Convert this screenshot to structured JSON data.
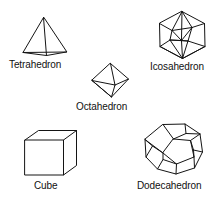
{
  "figure": {
    "title_text": "",
    "background_color": "#ffffff",
    "stroke_color": "#141414",
    "label_color": "#111111",
    "type": "line-drawing",
    "solids": [
      {
        "id": "tetrahedron",
        "label": "Tetrahedron",
        "faces": 4,
        "face_shape": "triangle",
        "label_position": "below"
      },
      {
        "id": "icosahedron",
        "label": "Icosahedron",
        "faces": 20,
        "face_shape": "triangle",
        "label_position": "below"
      },
      {
        "id": "octahedron",
        "label": "Octahedron",
        "faces": 8,
        "face_shape": "triangle",
        "label_position": "below"
      },
      {
        "id": "cube",
        "label": "Cube",
        "faces": 6,
        "face_shape": "square",
        "label_position": "below"
      },
      {
        "id": "dodecahedron",
        "label": "Dodecahedron",
        "faces": 12,
        "face_shape": "pentagon",
        "label_position": "below"
      }
    ]
  }
}
